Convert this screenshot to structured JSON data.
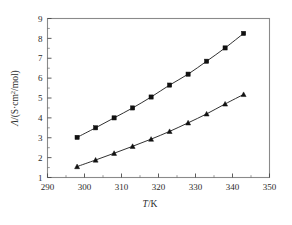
{
  "chart_data": {
    "type": "line",
    "title": "",
    "subtitle": "",
    "xlabel": "T/K",
    "ylabel": "Λ/(S·cm²/mol)",
    "xlim": [
      290,
      350
    ],
    "ylim": [
      1,
      9
    ],
    "xticks": [
      290,
      300,
      310,
      320,
      330,
      340,
      350
    ],
    "xtick_labels": [
      "290",
      "300",
      "310",
      "320",
      "330",
      "340",
      "350"
    ],
    "yticks": [
      1,
      2,
      3,
      4,
      5,
      6,
      7,
      8,
      9
    ],
    "ytick_labels": [
      "1",
      "2",
      "3",
      "4",
      "5",
      "6",
      "7",
      "8",
      "9"
    ],
    "x_minor_ticks": [
      295,
      305,
      315,
      325,
      335,
      345
    ],
    "y_minor_ticks": [
      1.5,
      2.5,
      3.5,
      4.5,
      5.5,
      6.5,
      7.5,
      8.5
    ],
    "grid": false,
    "legend": false,
    "legend_position": "none",
    "annotations": [],
    "x": [
      298,
      303,
      308,
      313,
      318,
      323,
      328,
      333,
      338,
      343
    ],
    "series": [
      {
        "name": "upper-series",
        "marker": "square",
        "color": "#111111",
        "values": [
          3.02,
          3.5,
          4.0,
          4.5,
          5.05,
          5.65,
          6.2,
          6.85,
          7.52,
          8.25
        ]
      },
      {
        "name": "lower-series",
        "marker": "triangle",
        "color": "#111111",
        "values": [
          1.55,
          1.88,
          2.22,
          2.57,
          2.93,
          3.32,
          3.75,
          4.2,
          4.7,
          5.18
        ]
      }
    ]
  },
  "figure": {
    "background_color": "#ffffff",
    "frame_color": "#8a8a8a",
    "axis_text_color": "#2b2b2b",
    "ylabel_parts": {
      "lambda": "Λ",
      "slash_open": "/(S·cm",
      "superscript": "2",
      "close": "/mol)"
    },
    "xlabel_parts": {
      "italic": "T",
      "rest": "/K"
    }
  }
}
